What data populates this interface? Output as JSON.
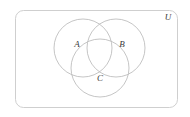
{
  "figure": {
    "type": "venn-diagram",
    "title": "",
    "background_color": "#ffffff"
  },
  "universe": {
    "label": "U",
    "label_x": 168,
    "label_y": 18,
    "rect": {
      "x": 15.5,
      "y": 10.5,
      "width": 162,
      "height": 97,
      "rx": 8
    },
    "stroke_color": "#c9c9c9",
    "fill_color": "#ffffff"
  },
  "sets": [
    {
      "label": "A",
      "cx": 83,
      "cy": 48,
      "r": 29,
      "label_x": 77,
      "label_y": 45,
      "stroke_color": "#b6b6b6"
    },
    {
      "label": "B",
      "cx": 116,
      "cy": 48,
      "r": 29,
      "label_x": 122,
      "label_y": 45,
      "stroke_color": "#b6b6b6"
    },
    {
      "label": "C",
      "cx": 100,
      "cy": 68,
      "r": 29,
      "label_x": 100,
      "label_y": 79,
      "stroke_color": "#b6b6b6"
    }
  ]
}
